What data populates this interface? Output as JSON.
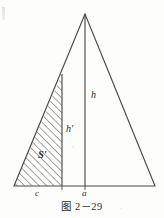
{
  "figure": {
    "caption": "图 2－29",
    "labels": {
      "altitude_full": "h",
      "altitude_partial": "h'",
      "area_region": "S'",
      "base_segment_left": "c",
      "base_segment_right": "a"
    },
    "colors": {
      "stroke": "#4a4a4a",
      "hatch": "#555555",
      "background": "#fdfdfc",
      "text": "#2b2b2b"
    },
    "geometry": {
      "apex": [
        85,
        14
      ],
      "bottom_left": [
        14,
        186
      ],
      "bottom_right": [
        155,
        186
      ],
      "altitude_x": 85,
      "divider_x": 62,
      "divider_top_y": 74,
      "base_y": 186
    }
  }
}
